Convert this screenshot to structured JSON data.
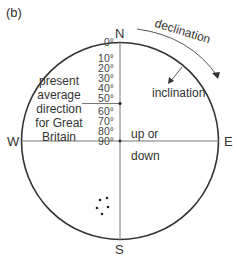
{
  "panel_label": "(b)",
  "compass": {
    "north": "N",
    "south": "S",
    "east": "E",
    "west": "W"
  },
  "annotations": {
    "declination": "declination",
    "inclination": "inclination",
    "present_direction_lines": [
      "present",
      "average",
      "direction",
      "for Great",
      "Britain"
    ],
    "up_or": "up or",
    "down": "down"
  },
  "inclination_ticks": [
    "0°",
    "10°",
    "20°",
    "30°",
    "40°",
    "50°",
    "60°",
    "70°",
    "80°",
    "90°"
  ],
  "colors": {
    "line": "#333333",
    "axis": "#777777",
    "background": "#ffffff"
  },
  "data_points": [
    {
      "x": 100,
      "y": 200
    },
    {
      "x": 107,
      "y": 198
    },
    {
      "x": 97,
      "y": 208
    },
    {
      "x": 108,
      "y": 207
    },
    {
      "x": 102,
      "y": 214
    }
  ]
}
